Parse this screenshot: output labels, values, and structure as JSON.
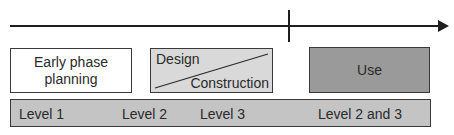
{
  "diagram": {
    "timeline": {
      "has_arrow": true,
      "milestone_marker": true
    },
    "phases": [
      {
        "label": "Early phase planning",
        "line1": "Early phase",
        "line2": "planning",
        "fill": "#ffffff"
      },
      {
        "label_top": "Design",
        "label_bottom": "Construction",
        "fill": "#d9d9d9",
        "split": "diagonal"
      },
      {
        "label": "Use",
        "fill": "#9a9a9a"
      }
    ],
    "levels_bar": {
      "fill": "#c4c4c4",
      "items": [
        "Level 1",
        "Level 2",
        "Level 3",
        "Level 2 and 3"
      ]
    }
  }
}
